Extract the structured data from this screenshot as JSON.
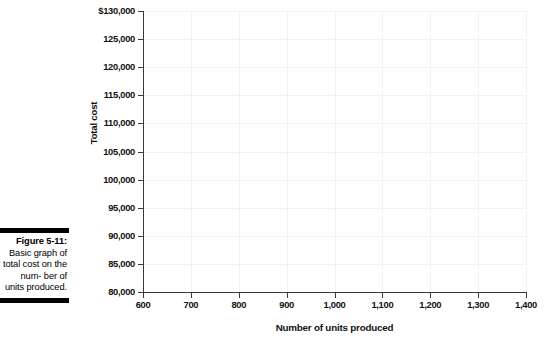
{
  "figure": {
    "caption_title": "Figure 5-11:",
    "caption_body": "Basic graph of total cost on the num- ber of units produced.",
    "rule_color": "#000000"
  },
  "chart_data": {
    "type": "line",
    "title": "",
    "subtitle": "",
    "xlabel": "Number of units produced",
    "ylabel": "Total cost",
    "xlim": [
      600,
      1400
    ],
    "ylim": [
      80000,
      130000
    ],
    "x_ticks": [
      600,
      700,
      800,
      900,
      1000,
      1100,
      1200,
      1300,
      1400
    ],
    "x_tick_labels": [
      "600",
      "700",
      "800",
      "900",
      "1,000",
      "1,100",
      "1,200",
      "1,300",
      "1,400"
    ],
    "y_ticks": [
      80000,
      85000,
      90000,
      95000,
      100000,
      105000,
      110000,
      115000,
      120000,
      125000,
      130000
    ],
    "y_tick_labels": [
      "80,000",
      "85,000",
      "90,000",
      "95,000",
      "100,000",
      "105,000",
      "110,000",
      "115,000",
      "120,000",
      "125,000",
      "$130,000"
    ],
    "series": [],
    "grid": true,
    "grid_color": "#f2f2f2",
    "axis_color": "#3a3a3a",
    "legend": null,
    "annotations": [],
    "note": "Empty plot area — axes and gridlines only, no data plotted"
  }
}
